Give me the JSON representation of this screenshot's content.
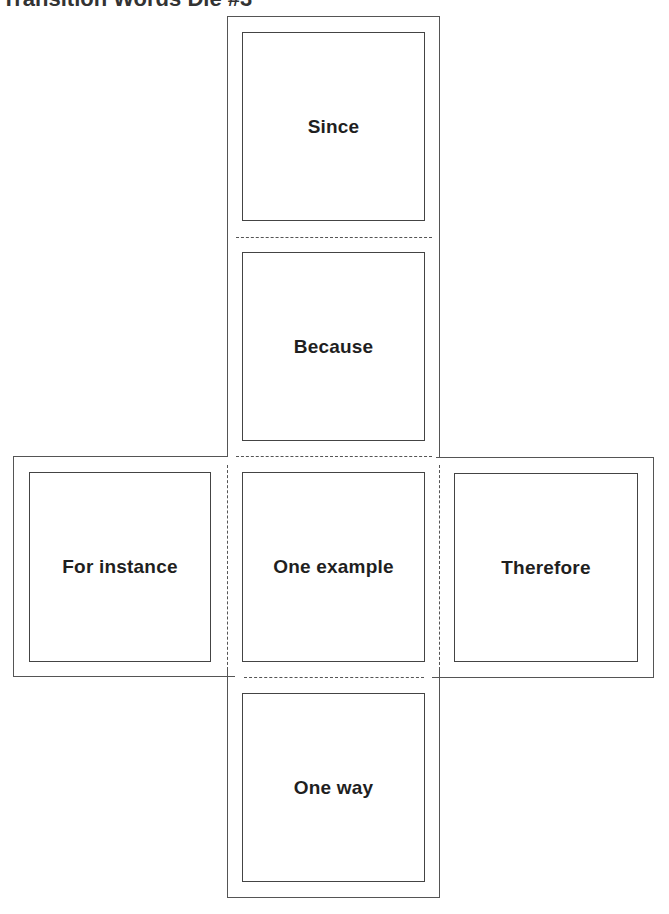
{
  "title": "Transition Words Die #3",
  "faces": {
    "top": "Since",
    "upper_middle": "Because",
    "left": "For instance",
    "center": "One example",
    "right": "Therefore",
    "bottom": "One way"
  },
  "colors": {
    "line": "#555555",
    "text": "#1f1f1f",
    "background": "#ffffff"
  }
}
